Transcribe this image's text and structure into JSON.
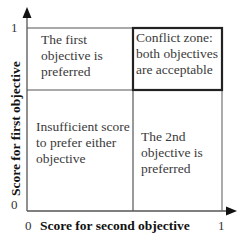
{
  "diagram": {
    "type": "quadrant",
    "x_axis": {
      "label": "Score for second objective",
      "min_tick": "0",
      "max_tick": "1"
    },
    "y_axis": {
      "label": "Score for first objective",
      "min_tick": "0",
      "max_tick": "1"
    },
    "quadrants": {
      "top_left": "The first\nobjective is\npreferred",
      "top_right": "Conflict zone:\nboth objectives\nare acceptable",
      "bottom_left": "Insufficient score\nto prefer either\nobjective",
      "bottom_right": "The 2nd\nobjective is\npreferred"
    },
    "highlighted_quadrant": "top_right",
    "colors": {
      "line": "#555555",
      "highlight_border": "#222222",
      "text": "#333333"
    }
  }
}
